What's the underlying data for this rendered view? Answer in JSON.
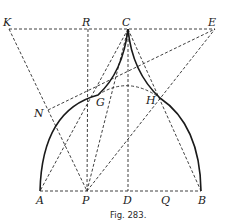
{
  "figure": {
    "caption": "Fig. 283.",
    "points": {
      "K": "K",
      "R": "R",
      "C": "C",
      "E": "E",
      "N": "N",
      "G": "G",
      "H": "H",
      "A": "A",
      "P": "P",
      "D": "D",
      "Q": "Q",
      "B": "B"
    },
    "colors": {
      "ink": "#1a1a1a",
      "background": "#ffffff"
    }
  }
}
